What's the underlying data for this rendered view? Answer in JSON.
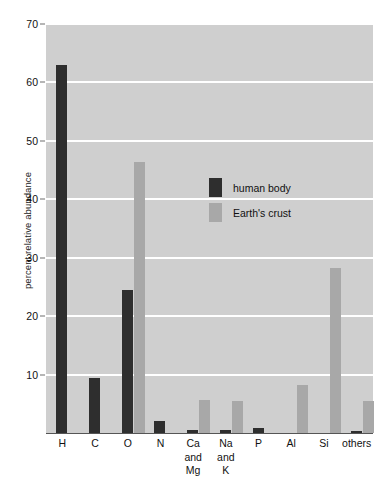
{
  "chart_data": {
    "type": "bar",
    "title": "",
    "xlabel": "",
    "ylabel": "percent relative abundance",
    "ylim": [
      0,
      70
    ],
    "yticks": [
      10,
      20,
      30,
      40,
      50,
      60,
      70
    ],
    "grid": true,
    "legend_position": "inside-upper-middle",
    "categories": [
      "H",
      "C",
      "O",
      "N",
      "Ca\nand\nMg",
      "Na\nand\nK",
      "P",
      "Al",
      "Si",
      "others"
    ],
    "category_lines": [
      [
        "H"
      ],
      [
        "C"
      ],
      [
        "O"
      ],
      [
        "N"
      ],
      [
        "Ca",
        "and",
        "Mg"
      ],
      [
        "Na",
        "and",
        "K"
      ],
      [
        "P"
      ],
      [
        "Al"
      ],
      [
        "Si"
      ],
      [
        "others"
      ]
    ],
    "series": [
      {
        "name": "human body",
        "color": "#2e2e2e",
        "values": [
          63.0,
          9.5,
          24.5,
          2.0,
          0.6,
          0.5,
          0.8,
          0.0,
          0.0,
          0.3
        ]
      },
      {
        "name": "Earth's crust",
        "color": "#a8a8a8",
        "values": [
          0.0,
          0.0,
          46.3,
          0.0,
          5.6,
          5.5,
          0.0,
          8.2,
          28.2,
          5.4
        ]
      }
    ]
  },
  "axes": {
    "y_label": "percent relative abundance",
    "y_tick_labels": [
      "70",
      "60",
      "50",
      "40",
      "30",
      "20",
      "10"
    ],
    "x_tick_labels": [
      "H",
      "C",
      "O",
      "N",
      "Ca and Mg",
      "Na and K",
      "P",
      "Al",
      "Si",
      "others"
    ]
  },
  "legend": {
    "items": [
      {
        "label": "human body",
        "color": "#2e2e2e"
      },
      {
        "label": "Earth's crust",
        "color": "#a8a8a8"
      }
    ]
  },
  "colors": {
    "plot_background": "#cfcfcf",
    "gridline": "#ffffff",
    "human_body_bar": "#2e2e2e",
    "earths_crust_bar": "#a8a8a8",
    "axis_line": "#555555",
    "text": "#111111",
    "page_background": "#ffffff"
  }
}
